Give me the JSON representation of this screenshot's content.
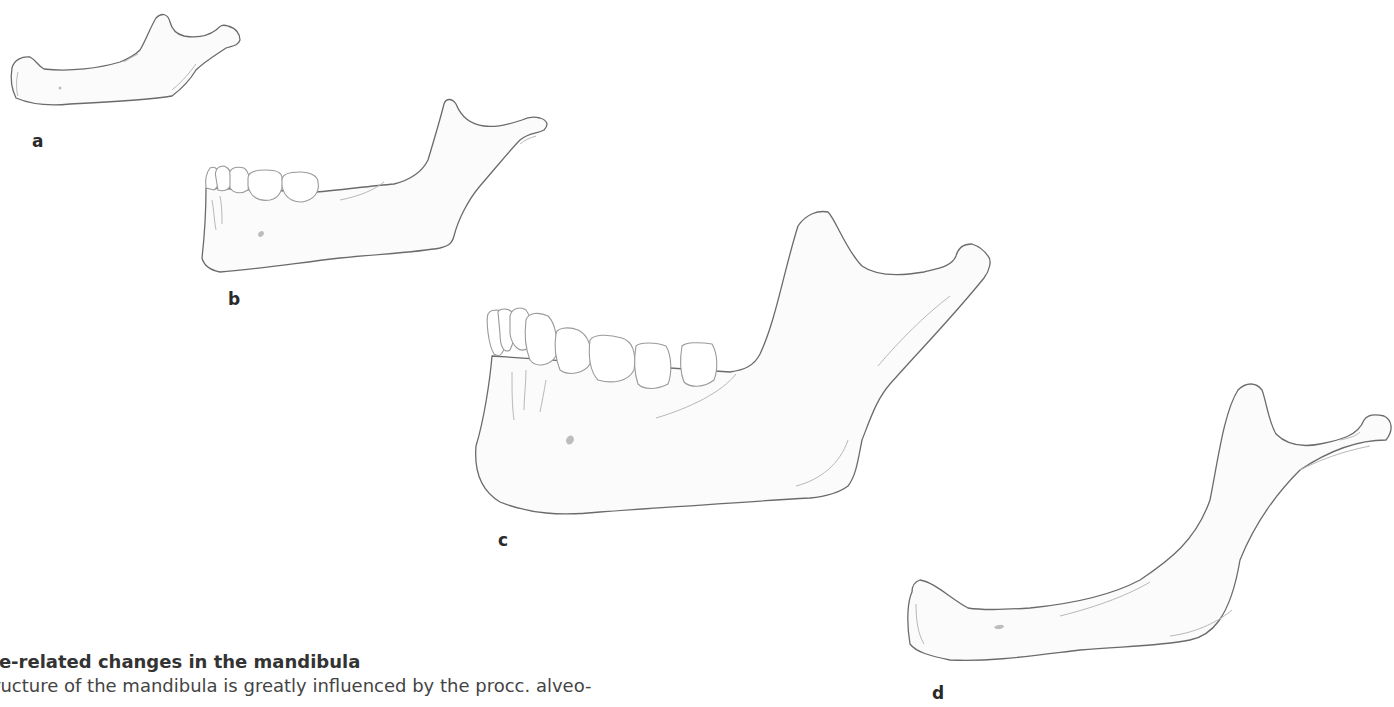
{
  "figure": {
    "panels": [
      {
        "id": "a",
        "label": "a",
        "description": "Newborn mandible, no teeth"
      },
      {
        "id": "b",
        "label": "b",
        "description": "Child mandible with deciduous teeth"
      },
      {
        "id": "c",
        "label": "c",
        "description": "Adult mandible with full dentition"
      },
      {
        "id": "d",
        "label": "d",
        "description": "Edentulous senile mandible"
      }
    ],
    "colors": {
      "outline": "#6b6b6b",
      "tooth_outline": "#9a9a9a",
      "fill": "#fbfbfb",
      "label": "#2a2a2a"
    }
  },
  "caption": {
    "title": "ge-related changes in the mandibula",
    "text": "tructure of the mandibula is greatly influenced by the procc. alveo-"
  }
}
